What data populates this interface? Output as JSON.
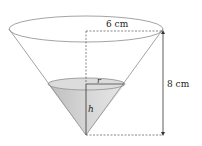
{
  "figure": {
    "labels": {
      "radius_top": "6 cm",
      "height_total": "8 cm",
      "water_radius": "r",
      "water_height": "h"
    },
    "colors": {
      "outline": "#8c8c8c",
      "water_fill": "#cfcfcf",
      "water_surface": "#dcdcdc",
      "dash": "#555555",
      "arrow": "#333333",
      "text": "#231f20"
    }
  }
}
